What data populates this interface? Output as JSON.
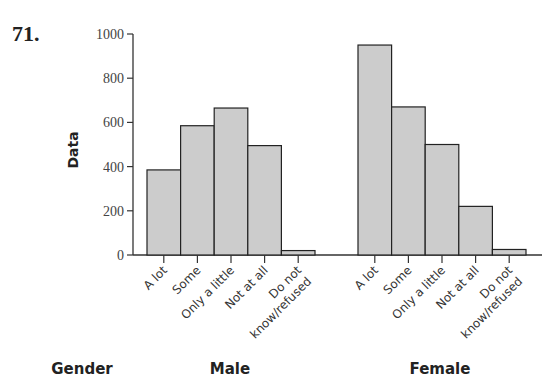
{
  "problem_number": "71.",
  "chart_data": {
    "type": "bar",
    "title": "",
    "xlabel": "Gender",
    "ylabel": "Data",
    "ylim": [
      0,
      1000
    ],
    "yticks": [
      0,
      200,
      400,
      600,
      800,
      1000
    ],
    "grid": false,
    "legend": "none",
    "categories": [
      "A lot",
      "Some",
      "Only a little",
      "Not at all",
      "Do not know/refused"
    ],
    "series": [
      {
        "name": "Male",
        "values": [
          385,
          585,
          665,
          495,
          20
        ]
      },
      {
        "name": "Female",
        "values": [
          950,
          670,
          500,
          220,
          25
        ]
      }
    ],
    "bar_color": "#cccccc",
    "bar_edge_color": "#222222"
  }
}
